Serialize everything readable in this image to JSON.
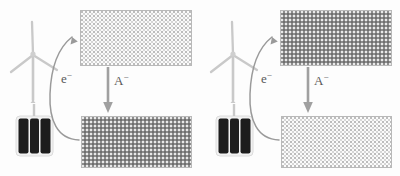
{
  "figure": {
    "title": "Renewable-powered electrochemical anion transfer diagram",
    "background_color": "#fdfdfd"
  },
  "labels": {
    "electron": "e",
    "electron_charge": "−",
    "anion": "A",
    "anion_charge": "−",
    "label_color": "#595959"
  },
  "icons": {
    "wind_turbine": "wind-turbine-icon",
    "solar_panel": "solar-panel-icon",
    "curved_arrow": "curved-arrow-icon",
    "down_arrow": "down-arrow-icon"
  },
  "colors": {
    "turbine": "#c9c9c9",
    "solar_panel": "#1d1d1d",
    "arrow": "#8f8f8f",
    "electrode_border": "#b9b9b9",
    "fill_light": "#fbfbfb",
    "fill_dark": "#8d8d8d"
  },
  "panels": [
    {
      "id": "left",
      "name": "panel-left",
      "sources": [
        "wind-turbine-icon",
        "solar-panel-icon"
      ],
      "electron_label": "e⁻",
      "anion_label": "A⁻",
      "top_electrode": {
        "name": "electrode-top",
        "fill": "light"
      },
      "bottom_electrode": {
        "name": "electrode-bottom",
        "fill": "dark"
      },
      "electron_arrow_direction": "up",
      "anion_arrow_direction": "down"
    },
    {
      "id": "right",
      "name": "panel-right",
      "sources": [
        "wind-turbine-icon",
        "solar-panel-icon"
      ],
      "electron_label": "e⁻",
      "anion_label": "A⁻",
      "top_electrode": {
        "name": "electrode-top",
        "fill": "dark"
      },
      "bottom_electrode": {
        "name": "electrode-bottom",
        "fill": "light"
      },
      "electron_arrow_direction": "up",
      "anion_arrow_direction": "down"
    }
  ]
}
